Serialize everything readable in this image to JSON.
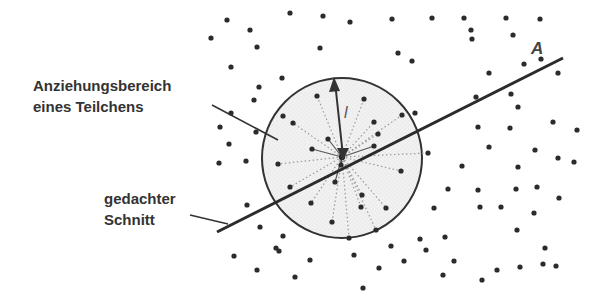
{
  "labels": {
    "attraction_region_line1": "Anziehungsbereich",
    "attraction_region_line2": "eines Teilchens",
    "cut_line1": "gedachter",
    "cut_line2": "Schnitt",
    "plane": "A",
    "radius": "l"
  },
  "colors": {
    "ink": "#2b2b2b",
    "circle_fill": "#eeeeee",
    "text": "#333333"
  },
  "circle": {
    "cx": 342,
    "cy": 158,
    "r": 80
  },
  "cut_line": {
    "x1": 217,
    "y1": 232,
    "x2": 563,
    "y2": 58
  },
  "center_particle": {
    "x": 342,
    "y": 157
  },
  "particles_outside": [
    [
      227,
      20
    ],
    [
      290,
      13
    ],
    [
      323,
      16
    ],
    [
      350,
      22
    ],
    [
      392,
      19
    ],
    [
      432,
      18
    ],
    [
      464,
      18
    ],
    [
      472,
      39
    ],
    [
      506,
      18
    ],
    [
      398,
      53
    ],
    [
      412,
      61
    ],
    [
      513,
      35
    ],
    [
      540,
      19
    ],
    [
      541,
      59
    ],
    [
      524,
      64
    ],
    [
      489,
      73
    ],
    [
      511,
      94
    ],
    [
      558,
      73
    ],
    [
      476,
      97
    ],
    [
      471,
      30
    ],
    [
      211,
      38
    ],
    [
      250,
      30
    ],
    [
      257,
      47
    ],
    [
      231,
      67
    ],
    [
      259,
      87
    ],
    [
      282,
      78
    ],
    [
      320,
      48
    ],
    [
      254,
      100
    ],
    [
      231,
      113
    ],
    [
      283,
      116
    ],
    [
      220,
      127
    ],
    [
      229,
      144
    ],
    [
      256,
      132
    ],
    [
      219,
      163
    ],
    [
      246,
      161
    ],
    [
      283,
      236
    ],
    [
      247,
      205
    ],
    [
      260,
      227
    ],
    [
      279,
      251
    ],
    [
      257,
      270
    ],
    [
      234,
      256
    ],
    [
      310,
      260
    ],
    [
      354,
      255
    ],
    [
      379,
      268
    ],
    [
      404,
      261
    ],
    [
      420,
      239
    ],
    [
      426,
      250
    ],
    [
      445,
      237
    ],
    [
      454,
      261
    ],
    [
      434,
      208
    ],
    [
      448,
      189
    ],
    [
      478,
      190
    ],
    [
      462,
      166
    ],
    [
      489,
      147
    ],
    [
      518,
      167
    ],
    [
      535,
      150
    ],
    [
      558,
      158
    ],
    [
      501,
      207
    ],
    [
      480,
      207
    ],
    [
      517,
      230
    ],
    [
      534,
      213
    ],
    [
      577,
      130
    ],
    [
      574,
      162
    ],
    [
      545,
      248
    ],
    [
      543,
      264
    ],
    [
      537,
      187
    ],
    [
      516,
      189
    ],
    [
      482,
      280
    ],
    [
      391,
      246
    ],
    [
      478,
      127
    ],
    [
      510,
      128
    ],
    [
      518,
      107
    ],
    [
      553,
      122
    ],
    [
      559,
      198
    ],
    [
      415,
      113
    ],
    [
      556,
      266
    ],
    [
      295,
      277
    ],
    [
      363,
      288
    ],
    [
      443,
      275
    ],
    [
      497,
      270
    ],
    [
      520,
      267
    ],
    [
      276,
      248
    ]
  ],
  "particles_inside": [
    [
      317,
      96
    ],
    [
      364,
      99
    ],
    [
      293,
      123
    ],
    [
      374,
      122
    ],
    [
      402,
      115
    ],
    [
      328,
      139
    ],
    [
      378,
      134
    ],
    [
      312,
      149
    ],
    [
      374,
      146
    ],
    [
      428,
      153
    ],
    [
      278,
      164
    ],
    [
      341,
      165
    ],
    [
      401,
      171
    ],
    [
      290,
      187
    ],
    [
      335,
      182
    ],
    [
      362,
      195
    ],
    [
      311,
      203
    ],
    [
      386,
      208
    ],
    [
      332,
      222
    ],
    [
      376,
      230
    ],
    [
      349,
      238
    ],
    [
      361,
      207
    ]
  ]
}
